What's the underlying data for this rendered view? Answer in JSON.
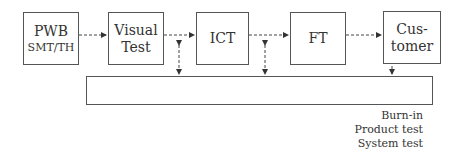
{
  "diagram": {
    "stages": [
      {
        "id": "pwb",
        "label": "PWB",
        "sublabel": "SMT/TH"
      },
      {
        "id": "visual",
        "label": "Visual",
        "label2": "Test"
      },
      {
        "id": "ict",
        "label": "ICT"
      },
      {
        "id": "ft",
        "label": "FT"
      },
      {
        "id": "customer",
        "label": "Cus-",
        "label2": "tomer"
      }
    ],
    "feedback_box": {
      "label": ""
    },
    "notes": [
      "Burn-in",
      "Product test",
      "System test"
    ]
  }
}
